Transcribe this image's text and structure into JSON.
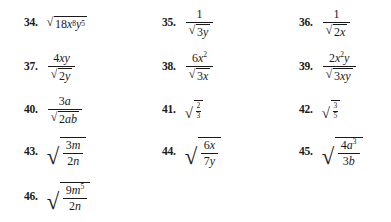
{
  "document": {
    "type": "math-exercise-set",
    "topic": "Simplifying radical expressions",
    "columns": 3,
    "rows": 5,
    "first_problem": 34,
    "last_problem": 46
  },
  "glyphs": {
    "radical_sign": "√"
  },
  "problems": [
    {
      "number": "34.",
      "expression_text": "sqrt(18x^8 y^5)",
      "parts": {
        "radicand_coefficient": "18",
        "var_x": "x",
        "exp_x": "8",
        "var_y": "y",
        "exp_y": "5"
      }
    },
    {
      "number": "35.",
      "expression_text": "1 / sqrt(3y)",
      "parts": {
        "numerator": "1",
        "radicand_coefficient": "3",
        "radicand_var": "y"
      }
    },
    {
      "number": "36.",
      "expression_text": "1 / sqrt(2x)",
      "parts": {
        "numerator": "1",
        "radicand_coefficient": "2",
        "radicand_var": "x"
      }
    },
    {
      "number": "37.",
      "expression_text": "4xy / sqrt(2y)",
      "parts": {
        "num_coefficient": "4",
        "num_var1": "x",
        "num_var2": "y",
        "radicand_coefficient": "2",
        "radicand_var": "y"
      }
    },
    {
      "number": "38.",
      "expression_text": "6x^2 / sqrt(3x)",
      "parts": {
        "num_coefficient": "6",
        "num_var": "x",
        "num_exp": "2",
        "radicand_coefficient": "3",
        "radicand_var": "x"
      }
    },
    {
      "number": "39.",
      "expression_text": "2x^2 y / sqrt(3xy)",
      "parts": {
        "num_coefficient": "2",
        "num_var1": "x",
        "num_exp": "2",
        "num_var2": "y",
        "radicand_coefficient": "3",
        "radicand_var1": "x",
        "radicand_var2": "y"
      }
    },
    {
      "number": "40.",
      "expression_text": "3a / sqrt(2ab)",
      "parts": {
        "num_coefficient": "3",
        "num_var": "a",
        "radicand_coefficient": "2",
        "radicand_var1": "a",
        "radicand_var2": "b"
      }
    },
    {
      "number": "41.",
      "expression_text": "sqrt(2/3)",
      "parts": {
        "radicand_numerator": "2",
        "radicand_denominator": "3"
      }
    },
    {
      "number": "42.",
      "expression_text": "sqrt(3/5)",
      "parts": {
        "radicand_numerator": "3",
        "radicand_denominator": "5"
      }
    },
    {
      "number": "43.",
      "expression_text": "sqrt(3m / 2n)",
      "parts": {
        "num_coefficient": "3",
        "num_var": "m",
        "den_coefficient": "2",
        "den_var": "n"
      }
    },
    {
      "number": "44.",
      "expression_text": "sqrt(6x / 7y)",
      "parts": {
        "num_coefficient": "6",
        "num_var": "x",
        "den_coefficient": "7",
        "den_var": "y"
      }
    },
    {
      "number": "45.",
      "expression_text": "sqrt(4a^3 / 3b)",
      "parts": {
        "num_coefficient": "4",
        "num_var": "a",
        "num_exp": "3",
        "den_coefficient": "3",
        "den_var": "b"
      }
    },
    {
      "number": "46.",
      "expression_text": "sqrt(9m^5 / 2n)",
      "parts": {
        "num_coefficient": "9",
        "num_var": "m",
        "num_exp": "5",
        "den_coefficient": "2",
        "den_var": "n"
      }
    }
  ]
}
